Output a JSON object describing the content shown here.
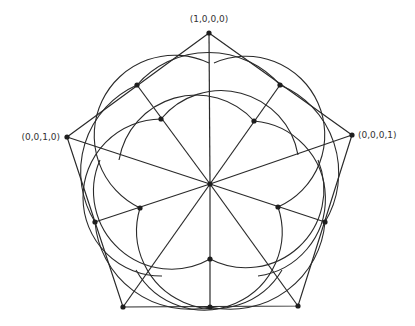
{
  "diagram": {
    "type": "simplex-projection",
    "labels": {
      "top": "(1,0,0,0)",
      "left": "(0,0,1,0)",
      "right": "(0,0,0,1)"
    },
    "colors": {
      "stroke": "#2a2a2a",
      "point": "#1e1e1e",
      "background": "#ffffff"
    },
    "pentagon_vertices": [
      {
        "name": "top",
        "x": 209,
        "y": 33
      },
      {
        "name": "right",
        "x": 352,
        "y": 135
      },
      {
        "name": "bottom-right",
        "x": 298,
        "y": 306
      },
      {
        "name": "bottom-left",
        "x": 123,
        "y": 307
      },
      {
        "name": "left",
        "x": 67,
        "y": 137
      }
    ],
    "center": {
      "x": 210,
      "y": 184
    },
    "edge_midpoints": [
      {
        "x": 137,
        "y": 85
      },
      {
        "x": 280,
        "y": 85
      },
      {
        "x": 325,
        "y": 222
      },
      {
        "x": 210,
        "y": 307
      },
      {
        "x": 95,
        "y": 222
      }
    ],
    "inner_points": [
      {
        "x": 161,
        "y": 119
      },
      {
        "x": 254,
        "y": 121
      },
      {
        "x": 278,
        "y": 207
      },
      {
        "x": 210,
        "y": 259
      },
      {
        "x": 140,
        "y": 208
      }
    ]
  }
}
